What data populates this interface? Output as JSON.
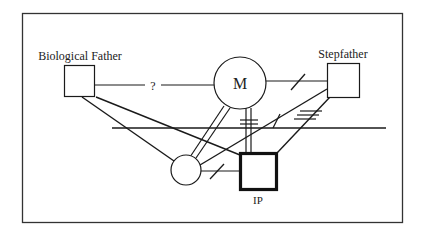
{
  "diagram": {
    "type": "genogram",
    "colors": {
      "stroke": "#1a1a1a",
      "frame": "#333333",
      "background": "#ffffff"
    },
    "nodes": [
      {
        "id": "biological_father",
        "label": "Biological Father",
        "shape": "square"
      },
      {
        "id": "mother",
        "label": "M",
        "shape": "circle"
      },
      {
        "id": "stepfather",
        "label": "Stepfather",
        "shape": "square"
      },
      {
        "id": "sibling",
        "label": "",
        "shape": "circle"
      },
      {
        "id": "ip",
        "label": "IP",
        "shape": "square-bold"
      }
    ],
    "edges": [
      {
        "from": "biological_father",
        "to": "mother",
        "style": "unknown",
        "label": "?"
      },
      {
        "from": "mother",
        "to": "stepfather",
        "style": "cutoff"
      },
      {
        "from": "mother",
        "to": "sibling",
        "style": "close"
      },
      {
        "from": "mother",
        "to": "ip",
        "style": "close-conflict"
      },
      {
        "from": "stepfather",
        "to": "sibling",
        "style": "cutoff-arrow"
      },
      {
        "from": "stepfather",
        "to": "ip",
        "style": "conflict"
      },
      {
        "from": "biological_father",
        "to": "sibling",
        "style": "line"
      },
      {
        "from": "biological_father",
        "to": "ip",
        "style": "line"
      },
      {
        "from": "sibling",
        "to": "ip",
        "style": "cutoff"
      }
    ],
    "boundary_line": "horizontal"
  }
}
